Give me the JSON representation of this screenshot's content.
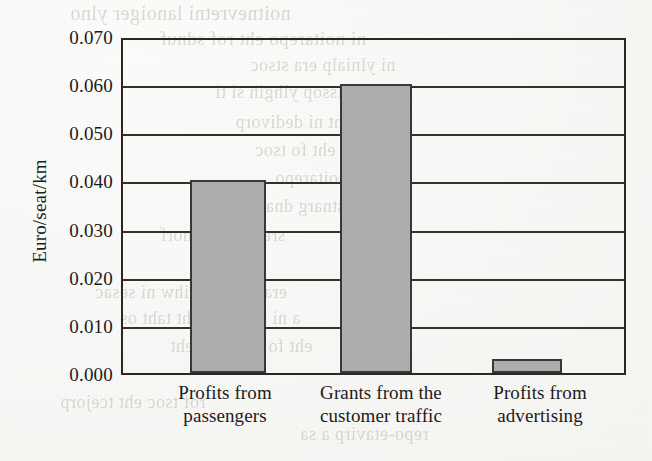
{
  "figure": {
    "background": "#f6f6f3",
    "ink_color": "#2a2825",
    "bar_fill": "#adadad",
    "bar_edge": "#3a3836"
  },
  "axis": {
    "y_title": "Euro/seat/km",
    "y_tick_labels": [
      "0.070",
      "0.060",
      "0.050",
      "0.040",
      "0.030",
      "0.020",
      "0.010",
      "0.000"
    ]
  },
  "x_labels": [
    {
      "line1": "Profits from",
      "line2": "passengers"
    },
    {
      "line1": "Grants from the",
      "line2": "customer traffic"
    },
    {
      "line1": "Profits from",
      "line2": "advertising"
    }
  ],
  "bleedthrough": [
    {
      "text": "noitnevretni  lanoiger  ylno",
      "left": 70,
      "top": 2,
      "size": 20
    },
    {
      "text": "ni  noitarepo  eht  rof  sdnuf",
      "left": 160,
      "top": 28,
      "size": 19
    },
    {
      "text": "ni  ylnialp  era  stsoc",
      "left": 250,
      "top": 55,
      "size": 18
    },
    {
      "text": "elbissop  ylhgih  si  ti",
      "left": 215,
      "top": 82,
      "size": 18
    },
    {
      "text": "erom  eht  ni  dedivorp",
      "left": 235,
      "top": 112,
      "size": 18
    },
    {
      "text": "ecivres  eht  fo  tsoc",
      "left": 255,
      "top": 140,
      "size": 18
    },
    {
      "text": "eht  fo  noitarepo",
      "left": 275,
      "top": 168,
      "size": 18
    },
    {
      "text": "stnarg  dna  stfiorp",
      "left": 210,
      "top": 196,
      "size": 18
    },
    {
      "text": "sregnessap  morf",
      "left": 160,
      "top": 225,
      "size": 18
    },
    {
      "text": "era  stnarg  hcihw  ni  sesac",
      "left": 95,
      "top": 282,
      "size": 18
    },
    {
      "text": "a  ni  sdnapxe  eht  taht  os",
      "left": 120,
      "top": 308,
      "size": 18
    },
    {
      "text": "eht  fo  ytilibaiv  eht",
      "left": 170,
      "top": 336,
      "size": 18
    },
    {
      "text": "rof  tsoc  eht  tcejorp",
      "left": 60,
      "top": 392,
      "size": 18
    },
    {
      "text": "repo-etavirp  a  sa",
      "left": 300,
      "top": 424,
      "size": 18
    }
  ],
  "chart_data": {
    "type": "bar",
    "title": "",
    "xlabel": "",
    "ylabel": "Euro/seat/km",
    "categories": [
      "Profits from passengers",
      "Grants from the customer traffic",
      "Profits from advertising"
    ],
    "values": [
      0.04,
      0.06,
      0.003
    ],
    "ylim": [
      0.0,
      0.07
    ],
    "ytick_values": [
      0.0,
      0.01,
      0.02,
      0.03,
      0.04,
      0.05,
      0.06,
      0.07
    ],
    "grid": "horizontal",
    "legend": "none",
    "bar_color": "#adadad"
  }
}
